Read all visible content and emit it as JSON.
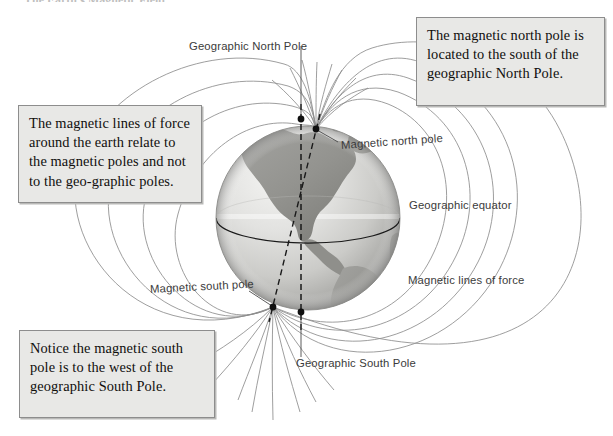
{
  "figure": {
    "kind": "earth-magnetic-field-diagram",
    "background_color": "#ffffff",
    "cut_off_heading": "The Earth's Magnetic Field",
    "callouts": [
      {
        "id": "north",
        "text": "The magnetic north pole is located to the south of the geographic North Pole.",
        "fill": "#e8e8e6",
        "border": "#8d8d8d"
      },
      {
        "id": "lines",
        "text": "The magnetic lines of force around the earth relate to the magnetic poles and not to the geo-graphic poles.",
        "fill": "#e8e8e6",
        "border": "#8d8d8d"
      },
      {
        "id": "south",
        "text": "Notice the magnetic south pole is to the west of the geographic South Pole.",
        "fill": "#e8e8e6",
        "border": "#8d8d8d"
      }
    ],
    "labels": {
      "geographic_north_pole": "Geographic North Pole",
      "magnetic_north_pole": "Magnetic north pole",
      "geographic_equator": "Geographic equator",
      "magnetic_lines_of_force": "Magnetic lines of force",
      "magnetic_south_pole": "Magnetic south pole",
      "geographic_south_pole": "Geographic South Pole"
    },
    "globe": {
      "center_x": 308,
      "center_y": 218,
      "radius": 92,
      "ocean_light": "#ececea",
      "ocean_mid": "#d6d6d3",
      "ocean_shadow": "#a8a8a5",
      "land_color": "#9a9a97",
      "land_dark": "#858582",
      "equator_color": "#1a1a1a",
      "continents": "North and South America"
    },
    "axes": {
      "rotation_axis": {
        "style": "dashed-vertical",
        "color": "#1a1a1a",
        "north_point": [
          301,
          119
        ],
        "south_point": [
          301,
          312
        ]
      },
      "magnetic_axis": {
        "style": "dashed-tilted",
        "color": "#1a1a1a",
        "north_point": [
          316,
          129
        ],
        "south_point": [
          273,
          307
        ]
      }
    },
    "field_lines": {
      "color": "#8c8c8c",
      "stroke_width": 0.8,
      "count": 16,
      "description": "Magnetic lines of force looping from the magnetic south pole around to the magnetic north pole"
    },
    "pole_markers": {
      "color": "#101010",
      "radius": 3.3,
      "points": [
        {
          "name": "geographic-north",
          "x": 301,
          "y": 119
        },
        {
          "name": "magnetic-north",
          "x": 316,
          "y": 129
        },
        {
          "name": "magnetic-south",
          "x": 273,
          "y": 307
        },
        {
          "name": "geographic-south",
          "x": 301,
          "y": 312
        }
      ]
    },
    "leader_lines": {
      "color": "#5a5a5a",
      "stroke_width": 0.8
    }
  }
}
